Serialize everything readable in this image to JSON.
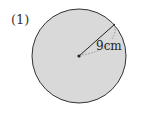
{
  "problem": {
    "number_label": "(1)"
  },
  "figure": {
    "shape": "circle",
    "fill_color": "#d9d9d9",
    "stroke_color": "#333333",
    "radius_label": "9cm",
    "radius_value": 9,
    "radius_unit": "cm"
  }
}
